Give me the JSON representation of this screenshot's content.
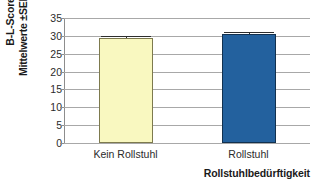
{
  "chart_data": {
    "type": "bar",
    "title": "",
    "subtitle": "",
    "categories": [
      "Kein Rollstuhl",
      "Rollstuhl"
    ],
    "values": [
      29.4,
      30.5
    ],
    "errors": [
      0.55,
      0.6
    ],
    "error_type": "SEM",
    "series": [
      {
        "name": "B-L-Score",
        "values": [
          29.4,
          30.5
        ],
        "errors": [
          0.55,
          0.6
        ]
      }
    ],
    "colors": [
      "#f9f8c0",
      "#23619e"
    ],
    "edge_colors": [
      "#7d7a4e",
      "#12314f"
    ],
    "xlabel": "Rollstuhlbedürftigkeit",
    "ylabel_line1": "B-L-Score",
    "ylabel_line2": "Mittelwerte ±SEM",
    "ylim": [
      0,
      35
    ],
    "yticks": [
      0,
      5,
      10,
      15,
      20,
      25,
      30,
      35
    ],
    "ytick_labels": [
      "0",
      "5",
      "10",
      "15",
      "20",
      "25",
      "30",
      "35"
    ],
    "grid": true,
    "grid_axis": "y",
    "legend": false,
    "legend_position": "none"
  }
}
